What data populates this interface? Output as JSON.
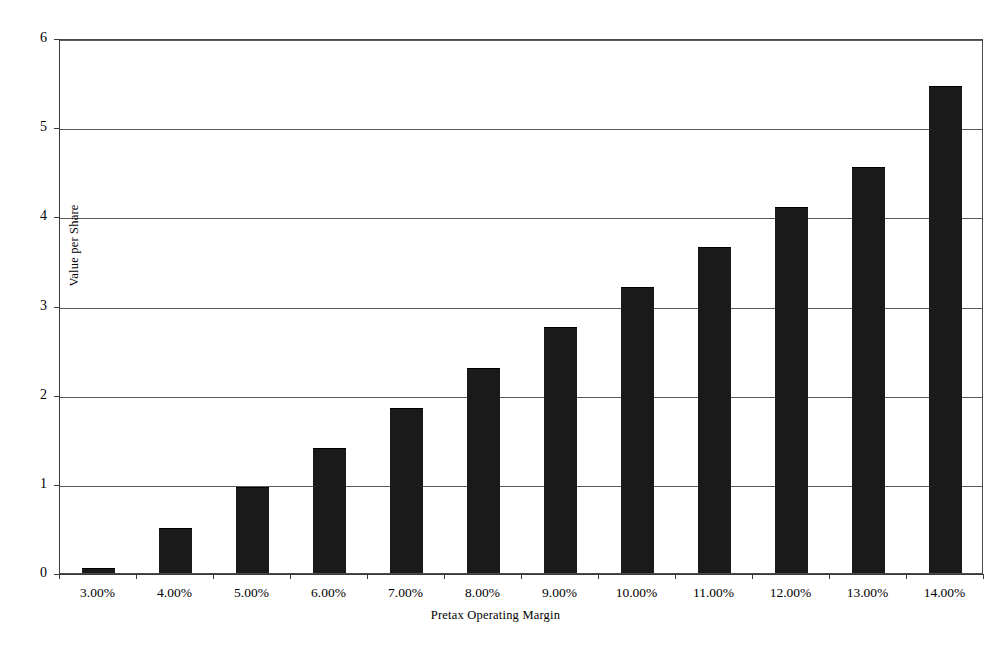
{
  "chart_data": {
    "type": "bar",
    "title": "",
    "xlabel": "Pretax Operating Margin",
    "ylabel": "Value per Share",
    "categories": [
      "3.00%",
      "4.00%",
      "5.00%",
      "6.00%",
      "7.00%",
      "8.00%",
      "9.00%",
      "10.00%",
      "11.00%",
      "12.00%",
      "13.00%",
      "14.00%"
    ],
    "values": [
      0.06,
      0.51,
      0.96,
      1.4,
      1.85,
      2.3,
      2.76,
      3.21,
      3.66,
      4.1,
      4.55,
      5.46
    ],
    "ylim": [
      0,
      6
    ],
    "y_ticks": [
      "0",
      "1",
      "2",
      "3",
      "4",
      "5",
      "6"
    ],
    "y_tick_values": [
      0,
      1,
      2,
      3,
      4,
      5,
      6
    ],
    "grid": true,
    "legend": "none",
    "bar_color": "#1a1a1a",
    "axis_color": "#3a3a3a",
    "grid_color": "#5a5a5a",
    "background": "#ffffff"
  }
}
